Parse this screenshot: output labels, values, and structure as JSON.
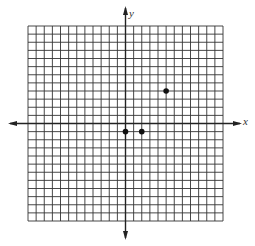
{
  "chart_data": {
    "type": "scatter",
    "title": "",
    "xlabel": "x",
    "ylabel": "y",
    "xlim": [
      -12,
      12
    ],
    "ylim": [
      -12,
      12
    ],
    "grid": true,
    "grid_step": 1,
    "tick_labels": false,
    "legend": null,
    "series": [
      {
        "name": "points",
        "points": [
          {
            "x": 0,
            "y": -1
          },
          {
            "x": 2,
            "y": -1
          },
          {
            "x": 5,
            "y": 4
          }
        ]
      }
    ]
  },
  "labels": {
    "x_axis": "x",
    "y_axis": "y"
  },
  "colors": {
    "grid": "#333333",
    "axis": "#222222",
    "point": "#111111"
  }
}
